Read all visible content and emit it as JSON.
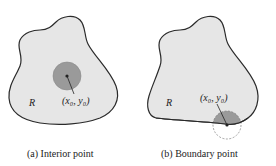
{
  "panels": [
    {
      "id": "a",
      "caption": "(a) Interior point",
      "region_label": "R",
      "point_label": "(x₀, y₀)",
      "point_type": "interior"
    },
    {
      "id": "b",
      "caption": "(b) Boundary point",
      "region_label": "R",
      "point_label": "(x₀, y₀)",
      "point_type": "boundary"
    }
  ],
  "colors": {
    "region_fill": "#e6e6e6",
    "region_stroke": "#2a2a2a",
    "disc_fill": "#9a9a9a",
    "dashed_circle": "#7a7a7a",
    "text": "#222222"
  }
}
